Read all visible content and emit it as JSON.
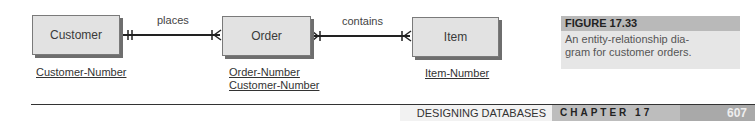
{
  "diagram": {
    "entities": [
      {
        "name": "Customer",
        "keys": [
          "Customer-Number"
        ]
      },
      {
        "name": "Order",
        "keys": [
          "Order-Number",
          "Customer-Number"
        ]
      },
      {
        "name": "Item",
        "keys": [
          "Item-Number"
        ]
      }
    ],
    "relationships": [
      {
        "label": "places",
        "from": "Customer",
        "to": "Order",
        "from_cardinality": "one-and-only-one",
        "to_cardinality": "one-or-many"
      },
      {
        "label": "contains",
        "from": "Order",
        "to": "Item",
        "from_cardinality": "one-or-many",
        "to_cardinality": "one-or-many"
      }
    ]
  },
  "caption": {
    "title": "FIGURE 17.33",
    "text_line1": "An entity-relationship dia-",
    "text_line2": "gram for customer orders."
  },
  "footer": {
    "section": "DESIGNING DATABASES",
    "chapter": "CHAPTER 17",
    "page": "607"
  }
}
